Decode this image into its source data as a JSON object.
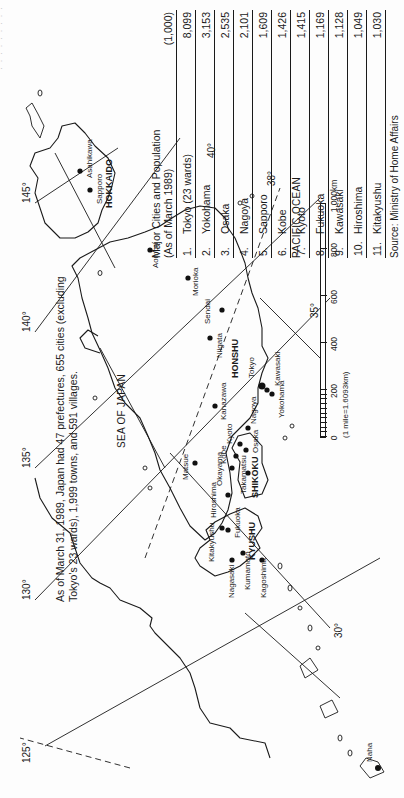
{
  "page": {
    "orientation": "rotated-90-ccw",
    "cropped_header_text": "· · · · · · · · ·"
  },
  "note": {
    "text": "As of March 31, 1989, Japan had 47 prefectures, 655 cities (excluding Tokyo's 23 wards), 1,999 towns, and 591 villages."
  },
  "map": {
    "seas": {
      "sea_of_japan": "SEA OF JAPAN",
      "pacific_ocean": "PACIFIC OCEAN"
    },
    "regions": {
      "hokkaido": "HOKKAIDO",
      "honshu": "HONSHU",
      "shikoku": "SHIKOKU",
      "kyushu": "KYUSHU"
    },
    "longitudes": {
      "lon_125": "125°",
      "lon_130": "130°",
      "lon_135": "135°",
      "lon_140": "140°",
      "lon_145": "145°"
    },
    "latitudes": {
      "lat_30": "30°",
      "lat_35": "35°",
      "lat_38": "38°",
      "lat_40": "40°"
    },
    "cities": {
      "asahikawa": "Asahikawa",
      "sapporo": "Sapporo",
      "aomori": "Aomori",
      "morioka": "Morioka",
      "sendai": "Sendai",
      "niigata": "Niigata",
      "tokyo": "Tokyo",
      "kawasaki": "Kawasaki",
      "yokohama": "Yokohama",
      "kanazawa": "Kanazawa",
      "nagoya": "Nagoya",
      "kyoto": "Kyoto",
      "osaka": "Osaka",
      "kobe": "Kobe",
      "okayama": "Okayama",
      "matsue": "Matsue",
      "hiroshima": "Hiroshima",
      "takamatsu": "Takamatsu",
      "kitakyushu": "Kitakyushu",
      "fukuoka": "Fukuoka",
      "nagasaki": "Nagasaki",
      "kumamoto": "Kumamoto",
      "kagoshima": "Kagoshima",
      "naha": "Naha"
    },
    "scale": {
      "labels": [
        "0",
        "200",
        "400",
        "600",
        "800",
        "1,000km"
      ],
      "note": "(1 mile=1.6093km)"
    }
  },
  "table": {
    "title_line1": "Major Cities and Population",
    "title_line2": "(As of March 1989)",
    "unit": "(1,000)",
    "rows": [
      {
        "rank": "1.",
        "city": "Tokyo (23 wards)",
        "population": "8,099"
      },
      {
        "rank": "2.",
        "city": "Yokohama",
        "population": "3,153"
      },
      {
        "rank": "3.",
        "city": "Osaka",
        "population": "2,535"
      },
      {
        "rank": "4.",
        "city": "Nagoya",
        "population": "2,101"
      },
      {
        "rank": "5.",
        "city": "Sapporo",
        "population": "1,609"
      },
      {
        "rank": "6.",
        "city": "Kobe",
        "population": "1,426"
      },
      {
        "rank": "7.",
        "city": "Kyoto",
        "population": "1,415"
      },
      {
        "rank": "8.",
        "city": "Fukuoka",
        "population": "1,169"
      },
      {
        "rank": "9.",
        "city": "Kawasaki",
        "population": "1,128"
      },
      {
        "rank": "10.",
        "city": "Hiroshima",
        "population": "1,049"
      },
      {
        "rank": "11.",
        "city": "Kitakyushu",
        "population": "1,030"
      }
    ],
    "source": "Source: Ministry of Home Affairs"
  }
}
